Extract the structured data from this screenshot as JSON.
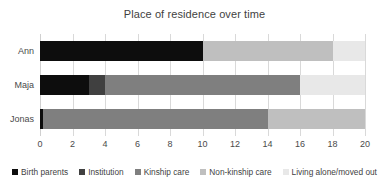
{
  "chart_data": {
    "type": "bar",
    "orientation": "horizontal",
    "stacked": true,
    "title": "Place of residence over time",
    "xlabel": "",
    "ylabel": "",
    "categories": [
      "Ann",
      "Maja",
      "Jonas"
    ],
    "series": [
      {
        "name": "Birth parents",
        "color": "#0d0d0d",
        "values": [
          10,
          3,
          0.2
        ]
      },
      {
        "name": "Institution",
        "color": "#404040",
        "values": [
          0,
          1,
          0
        ]
      },
      {
        "name": "Kinship care",
        "color": "#7f7f7f",
        "values": [
          0,
          12,
          13.8
        ]
      },
      {
        "name": "Non-kinship care",
        "color": "#bfbfbf",
        "values": [
          8,
          0,
          6
        ]
      },
      {
        "name": "Living alone/moved out",
        "color": "#e8e8e8",
        "values": [
          2,
          4,
          0
        ]
      }
    ],
    "xlim": [
      0,
      20
    ],
    "xticks": [
      "0",
      "2",
      "4",
      "6",
      "8",
      "10",
      "12",
      "14",
      "16",
      "18",
      "20"
    ],
    "xtick_values": [
      0,
      2,
      4,
      6,
      8,
      10,
      12,
      14,
      16,
      18,
      20
    ],
    "grid": "vertical",
    "legend_position": "bottom",
    "legend": [
      "Birth parents",
      "Institution",
      "Kinship care",
      "Non-kinship care",
      "Living alone/moved out"
    ]
  },
  "colors": {
    "background": "#ffffff",
    "text": "#3f3f3f",
    "gridline": "#d9d9d9"
  }
}
